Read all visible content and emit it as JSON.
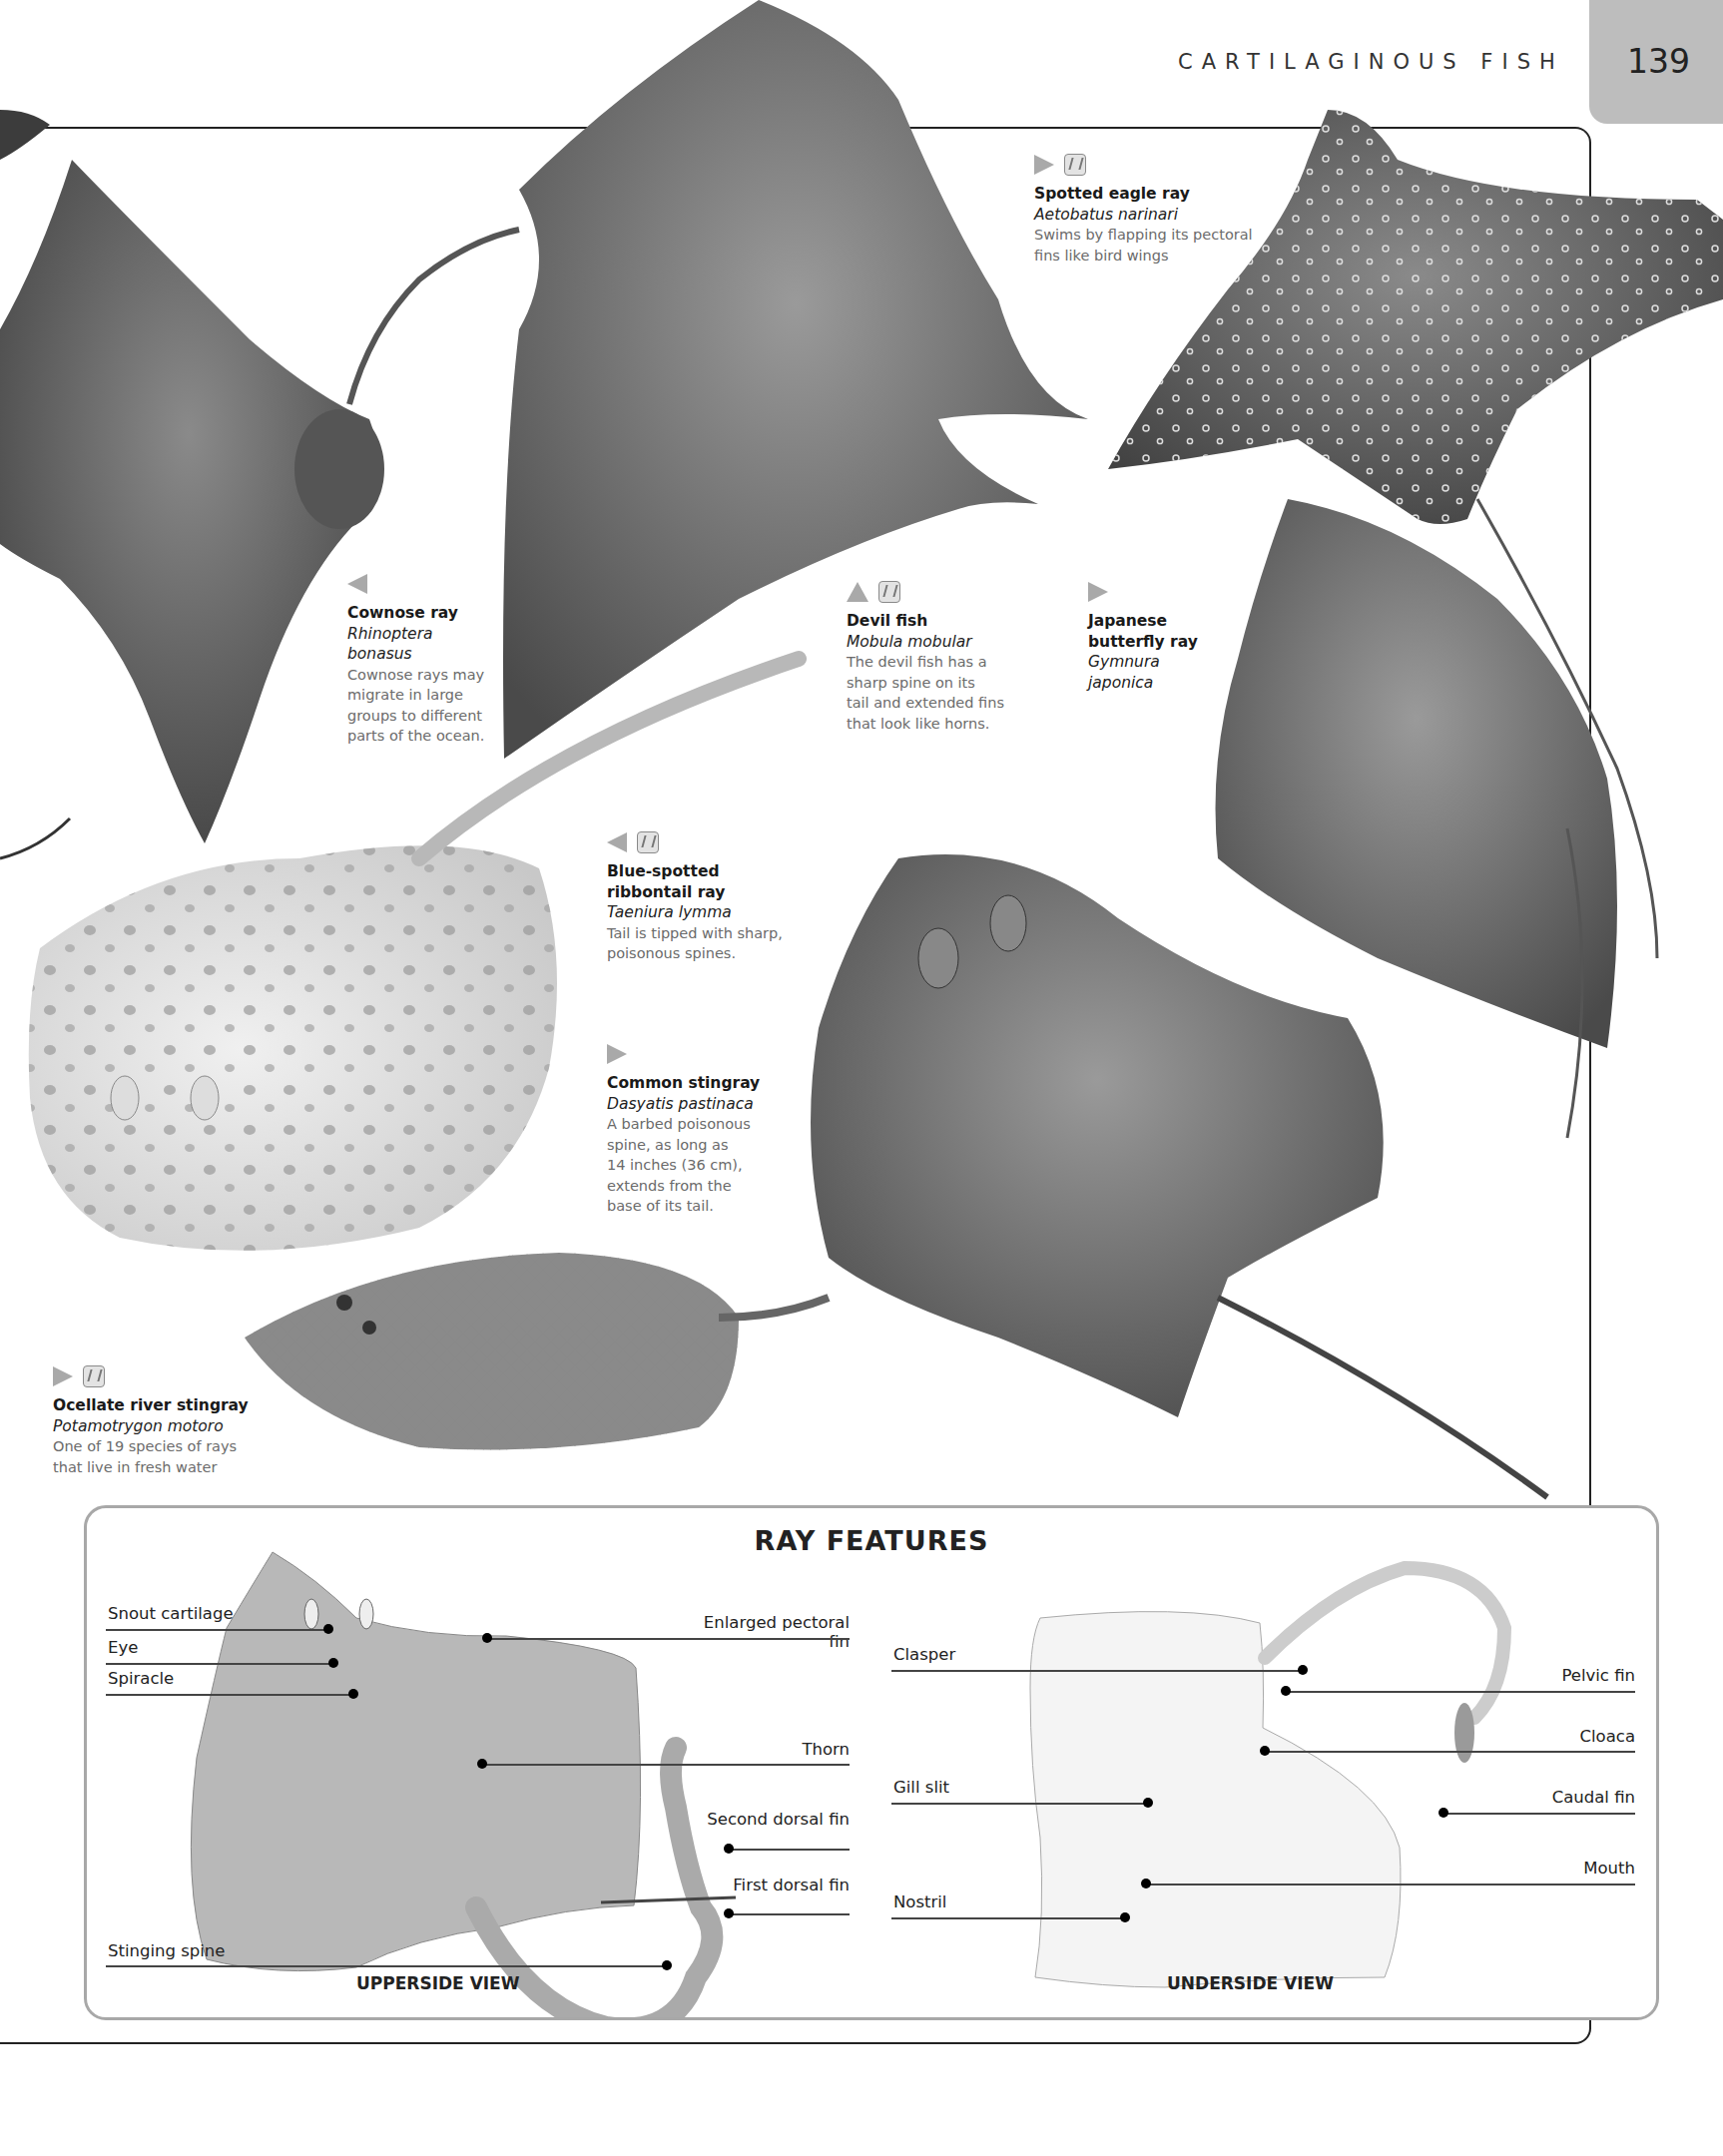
{
  "header": {
    "section_title": "CARTILAGINOUS FISH",
    "page_number": "139"
  },
  "legend_icons": {
    "arrow": "direction-arrow-icon",
    "danger": "danger-icon"
  },
  "species": [
    {
      "id": "spotted-eagle-ray",
      "arrow": "right",
      "danger": true,
      "common_name": "Spotted eagle ray",
      "scientific_name": "Aetobatus narinari",
      "description_lines": [
        "Swims by flapping its pectoral",
        "fins like bird wings"
      ]
    },
    {
      "id": "cownose-ray",
      "arrow": "left",
      "danger": false,
      "common_name": "Cownose ray",
      "scientific_name_lines": [
        "Rhinoptera",
        "bonasus"
      ],
      "description_lines": [
        "Cownose rays may",
        "migrate in large",
        "groups to different",
        "parts of the ocean."
      ]
    },
    {
      "id": "devil-fish",
      "arrow": "up",
      "danger": true,
      "common_name": "Devil fish",
      "scientific_name": "Mobula mobular",
      "description_lines": [
        "The devil fish has a",
        "sharp spine on its",
        "tail and extended fins",
        "that look like horns."
      ]
    },
    {
      "id": "japanese-butterfly-ray",
      "arrow": "right",
      "danger": false,
      "common_name_lines": [
        "Japanese",
        "butterfly ray"
      ],
      "scientific_name_lines": [
        "Gymnura",
        "japonica"
      ]
    },
    {
      "id": "blue-spotted-ribbontail-ray",
      "arrow": "left",
      "danger": true,
      "common_name_lines": [
        "Blue-spotted",
        "ribbontail ray"
      ],
      "scientific_name": "Taeniura lymma",
      "description_lines": [
        "Tail is tipped with sharp,",
        "poisonous spines."
      ]
    },
    {
      "id": "common-stingray",
      "arrow": "right",
      "danger": false,
      "common_name": "Common stingray",
      "scientific_name": "Dasyatis pastinaca",
      "description_lines": [
        "A barbed poisonous",
        "spine, as long as",
        "14 inches (36 cm),",
        "extends from the",
        "base of its tail."
      ]
    },
    {
      "id": "ocellate-river-stingray",
      "arrow": "right",
      "danger": true,
      "common_name": "Ocellate river stingray",
      "scientific_name": "Potamotrygon motoro",
      "description_lines": [
        "One of 19 species of rays",
        "that live in fresh water"
      ]
    }
  ],
  "features_box": {
    "title": "RAY FEATURES",
    "upperside": {
      "view_label": "UPPERSIDE VIEW",
      "labels_left": [
        "Snout cartilage",
        "Eye",
        "Spiracle",
        "Stinging spine"
      ],
      "labels_right": [
        "Enlarged pectoral fin",
        "Thorn",
        "Second dorsal fin",
        "First dorsal fin"
      ]
    },
    "underside": {
      "view_label": "UNDERSIDE VIEW",
      "labels_left": [
        "Clasper",
        "Gill slit",
        "Nostril"
      ],
      "labels_right": [
        "Pelvic fin",
        "Cloaca",
        "Caudal fin",
        "Mouth"
      ]
    }
  },
  "colors": {
    "page_tab": "#bdbdbd",
    "marker_gray": "#a9a9a9",
    "caption_desc": "#6b6b6b",
    "box_border": "#a8a8a8",
    "upperside_fill": "#b8b8b8",
    "underside_fill": "#f4f4f4"
  }
}
